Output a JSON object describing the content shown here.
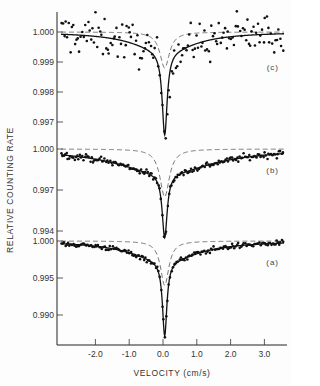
{
  "chart_data": {
    "type": "scatter",
    "title": "",
    "xlabel": "VELOCITY (cm/s)",
    "ylabel": "RELATIVE COUNTING RATE",
    "xlim": [
      -3.2,
      3.6
    ],
    "x_ticks": [
      -2.0,
      -1.0,
      0.0,
      1.0,
      2.0,
      3.0
    ],
    "x_tick_labels": [
      "-2.0",
      "-1.0",
      "0.0",
      "1.0",
      "2.0",
      "3.0"
    ],
    "grid": false,
    "legend": "none",
    "panels": [
      {
        "label": "(c)",
        "y_ticks": [
          1.0,
          0.999,
          0.998,
          0.997
        ],
        "y_tick_labels": [
          "1.000",
          "0.999",
          "0.998",
          "0.997"
        ],
        "baseline": 1.0,
        "min_value": 0.99657,
        "min_velocity": 0.05,
        "series": [
          {
            "name": "data points",
            "style": "dots",
            "noise": 0.00035,
            "count": 150
          },
          {
            "name": "fitted total",
            "style": "solid",
            "narrow_depth": 0.0028,
            "narrow_width": 0.09,
            "broad_depth": 0.00063,
            "broad_width": 1.1
          },
          {
            "name": "component",
            "style": "dashed",
            "depth": 0.0012,
            "width": 0.17
          }
        ]
      },
      {
        "label": "(b)",
        "y_ticks": [
          1.0,
          0.997,
          0.994
        ],
        "y_tick_labels": [
          "1.000",
          "0.997",
          "0.994"
        ],
        "baseline": 1.0,
        "min_value": 0.99349,
        "min_velocity": 0.05,
        "series": [
          {
            "name": "data points",
            "style": "dots",
            "noise": 0.00012,
            "count": 170
          },
          {
            "name": "fitted total",
            "style": "solid",
            "narrow_depth": 0.0047,
            "narrow_width": 0.09,
            "broad_depth": 0.0018,
            "broad_width": 1.7
          },
          {
            "name": "component",
            "style": "dashed",
            "depth": 0.0035,
            "width": 0.17
          }
        ]
      },
      {
        "label": "(a)",
        "y_ticks": [
          1.0,
          0.995,
          0.99
        ],
        "y_tick_labels": [
          "1.000",
          "0.995",
          "0.990"
        ],
        "baseline": 1.0,
        "min_value": 0.98716,
        "min_velocity": 0.05,
        "series": [
          {
            "name": "data points",
            "style": "dots",
            "noise": 0.00018,
            "count": 170
          },
          {
            "name": "fitted total",
            "style": "solid",
            "narrow_depth": 0.0101,
            "narrow_width": 0.08,
            "broad_depth": 0.0027,
            "broad_width": 1.2
          },
          {
            "name": "component",
            "style": "dashed",
            "depth": 0.006,
            "width": 0.15
          }
        ]
      }
    ]
  },
  "axes": {
    "x_title": "VELOCITY (cm/s)",
    "y_title": "RELATIVE COUNTING RATE"
  }
}
